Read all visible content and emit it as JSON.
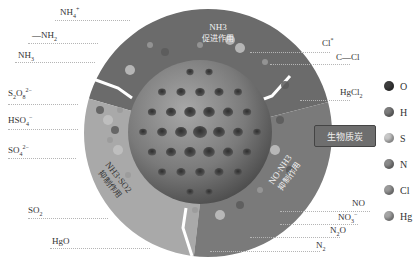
{
  "diagram": {
    "center_label": "生物质炭",
    "segments": [
      {
        "id": "top",
        "line1": "NH3",
        "line2": "促进作用",
        "shade": "#6b6b6b"
      },
      {
        "id": "left",
        "line1": "NH3·SO2",
        "line2": "抑制作用",
        "shade": "#a9a9a9"
      },
      {
        "id": "right",
        "line1": "NO·NH3",
        "line2": "抑制作用",
        "shade": "#7a7a7a"
      }
    ],
    "left_labels": [
      {
        "base": "NH",
        "sub": "4",
        "sup": "+"
      },
      {
        "base": "—NH",
        "sub": "2",
        "sup": ""
      },
      {
        "base": "NH",
        "sub": "3",
        "sup": ""
      },
      {
        "base": "S",
        "sub": "2",
        "mid": "O",
        "sub2": "8",
        "sup": "2−"
      },
      {
        "base": "HSO",
        "sub": "4",
        "sup": "−"
      },
      {
        "base": "SO",
        "sub": "4",
        "sup": "2−"
      },
      {
        "base": "SO",
        "sub": "2",
        "sup": ""
      },
      {
        "base": "HgO",
        "sub": "",
        "sup": ""
      }
    ],
    "right_labels": [
      {
        "base": "Cl",
        "sub": "",
        "sup": "*"
      },
      {
        "base": "C—Cl",
        "sub": "",
        "sup": ""
      },
      {
        "base": "HgCl",
        "sub": "2",
        "sup": ""
      },
      {
        "base": "NO",
        "sub": "",
        "sup": ""
      },
      {
        "base": "NO",
        "sub": "3",
        "sup": "−"
      },
      {
        "base": "N",
        "sub": "2",
        "mid": "O",
        "sup": ""
      },
      {
        "base": "N",
        "sub": "2",
        "sup": ""
      }
    ],
    "legend": [
      {
        "label": "O",
        "color": "#3d3d3d"
      },
      {
        "label": "H",
        "color": "#7d7d7d"
      },
      {
        "label": "S",
        "color": "#c8c8c8"
      },
      {
        "label": "N",
        "color": "#8a8a8a"
      },
      {
        "label": "Cl",
        "color": "#9a9a9a"
      },
      {
        "label": "Hg",
        "color": "#a5a5a5"
      }
    ]
  }
}
